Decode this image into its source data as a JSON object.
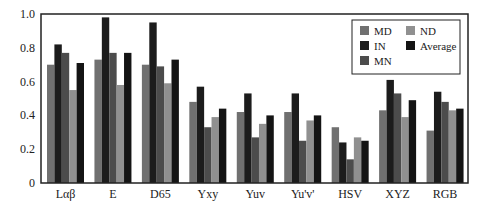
{
  "chart_data": {
    "type": "bar",
    "title": "",
    "xlabel": "",
    "ylabel": "",
    "ylim": [
      0,
      1.0
    ],
    "yticks": [
      "0",
      "0.2",
      "0.4",
      "0.6",
      "0.8",
      "1.0"
    ],
    "ytick_values": [
      0,
      0.2,
      0.4,
      0.6,
      0.8,
      1.0
    ],
    "grid": false,
    "legend_position": "top-right",
    "categories": [
      "Lαβ",
      "E",
      "D65",
      "Yxy",
      "Yuv",
      "Yu'v'",
      "HSV",
      "XYZ",
      "RGB"
    ],
    "series": [
      {
        "name": "MD",
        "color": "#707070",
        "values": [
          0.7,
          0.73,
          0.7,
          0.48,
          0.42,
          0.42,
          0.33,
          0.43,
          0.31
        ]
      },
      {
        "name": "IN",
        "color": "#1c1c1c",
        "values": [
          0.82,
          0.98,
          0.95,
          0.57,
          0.53,
          0.53,
          0.24,
          0.61,
          0.54
        ]
      },
      {
        "name": "MN",
        "color": "#4c4c4c",
        "values": [
          0.77,
          0.77,
          0.69,
          0.33,
          0.27,
          0.25,
          0.14,
          0.53,
          0.48
        ]
      },
      {
        "name": "ND",
        "color": "#909090",
        "values": [
          0.55,
          0.58,
          0.59,
          0.39,
          0.35,
          0.37,
          0.27,
          0.39,
          0.43
        ]
      },
      {
        "name": "Average",
        "color": "#141414",
        "values": [
          0.71,
          0.77,
          0.73,
          0.44,
          0.4,
          0.4,
          0.25,
          0.49,
          0.44
        ]
      }
    ],
    "legend": [
      {
        "name": "MD",
        "color": "#707070"
      },
      {
        "name": "ND",
        "color": "#909090"
      },
      {
        "name": "IN",
        "color": "#1c1c1c"
      },
      {
        "name": "Average",
        "color": "#141414"
      },
      {
        "name": "MN",
        "color": "#4c4c4c"
      }
    ]
  }
}
